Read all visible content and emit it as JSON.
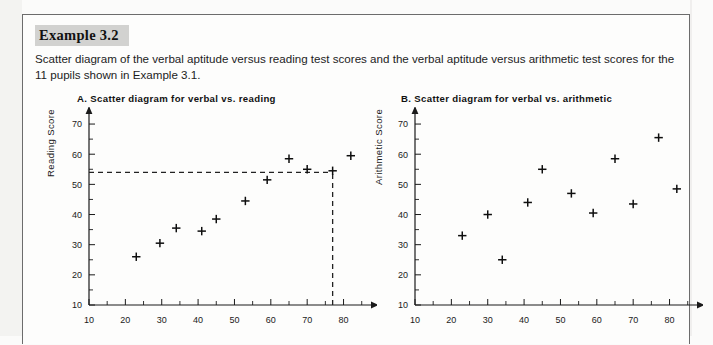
{
  "page": {
    "background_color": "#fbfbfa",
    "border_color": "#6c6c6c"
  },
  "example": {
    "header_label": "Example 3.2",
    "header_bg": "#d2d2d0",
    "description": "Scatter diagram of the verbal aptitude versus reading test scores and the verbal aptitude versus arithmetic test scores for the 11 pupils shown in Example 3.1."
  },
  "chart_data": [
    {
      "id": "chart-a",
      "type": "scatter",
      "title": "A. Scatter diagram for verbal vs. reading",
      "xlabel": "",
      "ylabel": "Reading Score",
      "xlim": [
        10,
        87
      ],
      "ylim": [
        10,
        73
      ],
      "xticks": [
        10,
        20,
        30,
        40,
        50,
        60,
        70,
        80
      ],
      "yticks": [
        10,
        20,
        30,
        40,
        50,
        60,
        70
      ],
      "xminor_step": 5,
      "yminor_step": 5,
      "grid": false,
      "legend": "none",
      "marker": "plus",
      "x": [
        23,
        29.5,
        34,
        41,
        45,
        53,
        59,
        65,
        70,
        77,
        82
      ],
      "y": [
        26,
        30.5,
        35.5,
        34.5,
        38.5,
        44.5,
        51.5,
        58.5,
        55,
        54.5,
        59.5
      ],
      "annotations": [
        {
          "name": "horizontal-guide",
          "type": "dashed-line",
          "orientation": "horizontal",
          "value": 54,
          "from": 10,
          "to": 77
        },
        {
          "name": "vertical-guide",
          "type": "dashed-line",
          "orientation": "vertical",
          "value": 77,
          "from": 10,
          "to": 54
        }
      ]
    },
    {
      "id": "chart-b",
      "type": "scatter",
      "title": "B. Scatter diagram for verbal vs. arithmetic",
      "xlabel": "",
      "ylabel": "Arithmetic  Score",
      "xlim": [
        10,
        87
      ],
      "ylim": [
        10,
        73
      ],
      "xticks": [
        10,
        20,
        30,
        40,
        50,
        60,
        70,
        80
      ],
      "yticks": [
        10,
        20,
        30,
        40,
        50,
        60,
        70
      ],
      "xminor_step": 5,
      "yminor_step": 5,
      "grid": false,
      "legend": "none",
      "marker": "plus",
      "x": [
        23,
        30,
        34,
        41,
        45,
        53,
        59,
        65,
        70,
        77,
        82
      ],
      "y": [
        33,
        40,
        25,
        44,
        55,
        47,
        40.5,
        58.5,
        43.5,
        65.5,
        48.5
      ],
      "annotations": []
    }
  ]
}
